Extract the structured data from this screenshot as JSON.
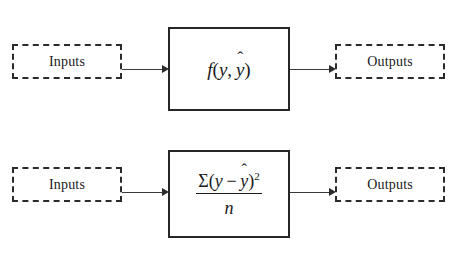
{
  "diagram": {
    "type": "block-flow",
    "background_color": "#ffffff",
    "line_color": "#2b2b2b",
    "text_color": "#1a1a1a",
    "rows": [
      {
        "id": "generic-loss",
        "input": {
          "label": "Inputs",
          "style": "dashed"
        },
        "process": {
          "style": "solid",
          "expression": "f(y, ŷ)",
          "notation": "function",
          "parts": {
            "function_name": "f",
            "open_paren": "(",
            "arg1": "y",
            "comma": ",",
            "arg2": "y",
            "arg2_accent": "̂",
            "close_paren": ")"
          }
        },
        "output": {
          "label": "Outputs",
          "style": "dashed"
        },
        "arrows": [
          {
            "from": "input",
            "to": "process",
            "direction": "right"
          },
          {
            "from": "process",
            "to": "output",
            "direction": "right"
          }
        ]
      },
      {
        "id": "mean-squared-error",
        "input": {
          "label": "Inputs",
          "style": "dashed"
        },
        "process": {
          "style": "solid",
          "expression": "Σ(y − ŷ)² / n",
          "notation": "fraction",
          "parts": {
            "sigma": "Σ",
            "open_paren": "(",
            "term1": "y",
            "minus": "−",
            "term2": "y",
            "term2_accent": "̂",
            "close_paren": ")",
            "exponent": "2",
            "denominator": "n"
          }
        },
        "output": {
          "label": "Outputs",
          "style": "dashed"
        },
        "arrows": [
          {
            "from": "input",
            "to": "process",
            "direction": "right"
          },
          {
            "from": "process",
            "to": "output",
            "direction": "right"
          }
        ]
      }
    ]
  }
}
